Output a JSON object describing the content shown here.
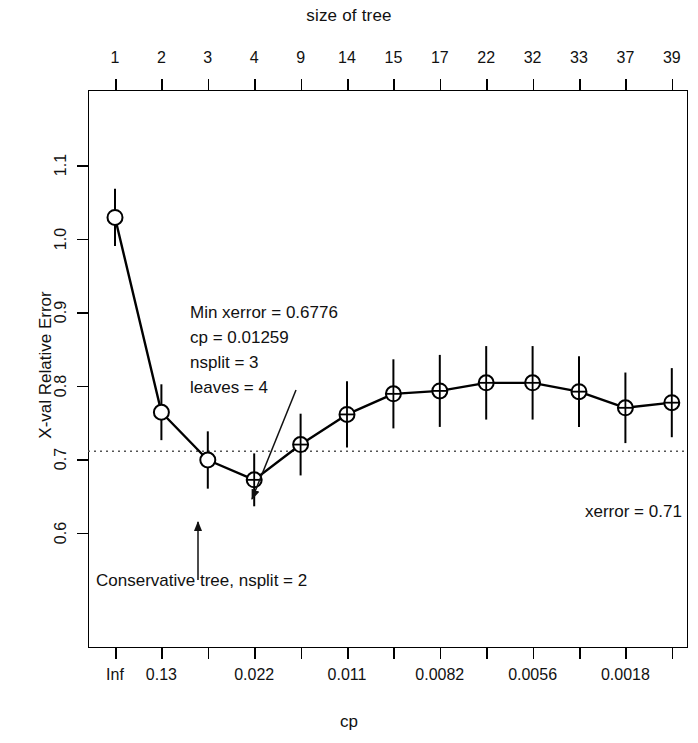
{
  "titles": {
    "top": "size of tree",
    "x": "cp",
    "y": "X-val Relative Error"
  },
  "annotations": {
    "min_block_line1": "Min xerror = 0.6776",
    "min_block_line2": "cp = 0.01259",
    "min_block_line3": "nsplit = 3",
    "min_block_line4": "leaves = 4",
    "conservative": "Conservative tree, nsplit = 2",
    "xerror_line": "xerror = 0.71"
  },
  "chart_data": {
    "type": "line",
    "title": "size of tree",
    "xlabel": "cp",
    "ylabel": "X-val Relative Error",
    "ylim": [
      0.545,
      1.145
    ],
    "yticks": [
      1.1,
      1.0,
      0.9,
      0.8,
      0.7,
      0.6
    ],
    "ytick_labels": [
      "1.1",
      "1.0",
      "0.9",
      "0.8",
      "0.7",
      "0.6"
    ],
    "grid": false,
    "legend": "none",
    "top_axis_label": "size of tree",
    "top_tick_labels": [
      "1",
      "2",
      "3",
      "4",
      "9",
      "14",
      "15",
      "17",
      "22",
      "32",
      "33",
      "37",
      "39"
    ],
    "bottom_tick_labels": [
      "Inf",
      "0.13",
      "",
      "0.022",
      "",
      "0.011",
      "",
      "0.0082",
      "",
      "0.0056",
      "",
      "0.0018",
      ""
    ],
    "x_index": [
      1,
      2,
      3,
      4,
      5,
      6,
      7,
      8,
      9,
      10,
      11,
      12,
      13
    ],
    "series": [
      {
        "name": "xerror",
        "values": [
          1.03,
          0.765,
          0.7,
          0.673,
          0.721,
          0.762,
          0.79,
          0.794,
          0.805,
          0.805,
          0.793,
          0.771,
          0.778
        ],
        "xstd_lower": [
          0.991,
          0.727,
          0.661,
          0.637,
          0.679,
          0.717,
          0.743,
          0.745,
          0.755,
          0.755,
          0.745,
          0.723,
          0.731
        ],
        "xstd_upper": [
          1.069,
          0.803,
          0.739,
          0.709,
          0.763,
          0.807,
          0.837,
          0.843,
          0.855,
          0.855,
          0.841,
          0.819,
          0.825
        ]
      }
    ],
    "reference_line": {
      "label": "xerror = 0.71",
      "value": 0.712,
      "style": "dotted"
    },
    "markers": {
      "plain_circle_indices": [
        1,
        2,
        3
      ],
      "crossed_circle_indices": [
        4,
        5,
        6,
        7,
        8,
        9,
        10,
        11,
        12,
        13
      ]
    },
    "arrows": [
      {
        "label": "Min xerror annotation arrow",
        "to_index": 4
      },
      {
        "label": "Conservative tree arrow",
        "to_index": 3
      }
    ]
  },
  "colors": {
    "line": "#000000",
    "axis": "#000000",
    "text": "#111111",
    "reference": "#555555",
    "background": "#ffffff"
  }
}
